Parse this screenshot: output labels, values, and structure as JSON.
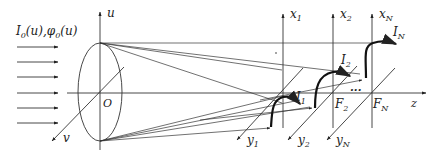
{
  "diagram": {
    "input_label": {
      "main1": "I",
      "sub1": "0",
      "arg1": "(u),",
      "main2": "φ",
      "sub2": "0",
      "arg2": "(u)"
    },
    "origin_label": "O",
    "axes": {
      "u": "u",
      "v": "v",
      "z": "z",
      "x1": {
        "main": "x",
        "sub": "1"
      },
      "x2": {
        "main": "x",
        "sub": "2"
      },
      "xN": {
        "main": "x",
        "sub": "N"
      },
      "y1": {
        "main": "y",
        "sub": "1"
      },
      "y2": {
        "main": "y",
        "sub": "2"
      },
      "yN": {
        "main": "y",
        "sub": "N"
      }
    },
    "focal_points": {
      "F2": {
        "main": "F",
        "sub": "2"
      },
      "FN": {
        "main": "F",
        "sub": "N"
      },
      "ellipsis": "···"
    },
    "intensity_labels": {
      "I1": {
        "main": "I",
        "sub": "1"
      },
      "I2": {
        "main": "I",
        "sub": "2"
      },
      "IN": {
        "main": "I",
        "sub": "N"
      }
    },
    "incident_arrow_count": 6,
    "colors": {
      "line": "#333333",
      "background": "#ffffff"
    }
  }
}
